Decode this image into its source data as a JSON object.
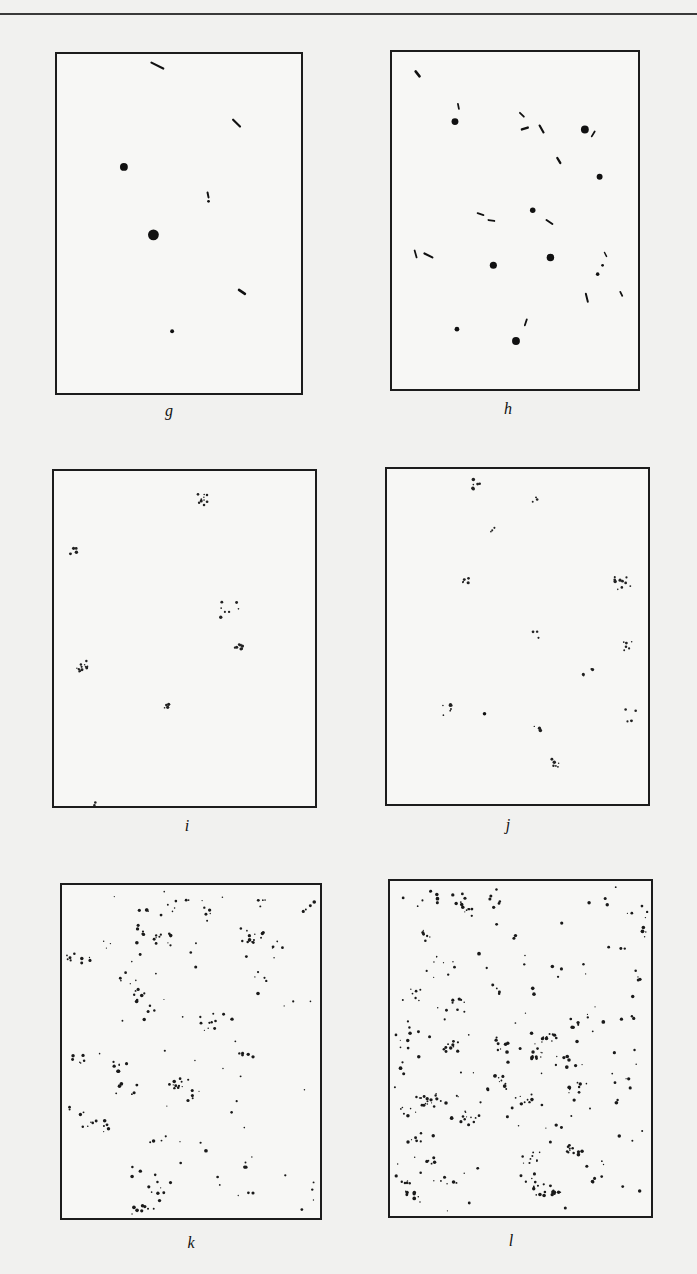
{
  "figure": {
    "panels": [
      {
        "id": "g",
        "label": "g",
        "box": [
          55,
          52,
          248,
          343
        ],
        "marks": [
          {
            "t": "line",
            "x1": 96,
            "y1": 8,
            "x2": 108,
            "y2": 14,
            "w": 2.2
          },
          {
            "t": "line",
            "x1": 179,
            "y1": 66,
            "x2": 186,
            "y2": 73,
            "w": 2.2
          },
          {
            "t": "dot",
            "cx": 68,
            "cy": 114,
            "r": 4
          },
          {
            "t": "line",
            "x1": 153,
            "y1": 140,
            "x2": 154,
            "y2": 145,
            "w": 2
          },
          {
            "t": "dot",
            "cx": 154,
            "cy": 149,
            "r": 1.4
          },
          {
            "t": "dot",
            "cx": 98,
            "cy": 183,
            "r": 5.5
          },
          {
            "t": "line",
            "x1": 185,
            "y1": 239,
            "x2": 191,
            "y2": 243,
            "w": 2.6
          },
          {
            "t": "dot",
            "cx": 117,
            "cy": 281,
            "r": 2
          }
        ]
      },
      {
        "id": "h",
        "label": "h",
        "box": [
          390,
          50,
          250,
          341
        ],
        "marks": [
          {
            "t": "line",
            "x1": 24,
            "y1": 19,
            "x2": 28,
            "y2": 24,
            "w": 2.6
          },
          {
            "t": "line",
            "x1": 67,
            "y1": 52,
            "x2": 68,
            "y2": 57,
            "w": 1.8
          },
          {
            "t": "dot",
            "cx": 64,
            "cy": 70,
            "r": 3.5
          },
          {
            "t": "line",
            "x1": 130,
            "y1": 61,
            "x2": 134,
            "y2": 65,
            "w": 1.8
          },
          {
            "t": "line",
            "x1": 132,
            "y1": 78,
            "x2": 138,
            "y2": 76,
            "w": 2.4
          },
          {
            "t": "line",
            "x1": 150,
            "y1": 74,
            "x2": 154,
            "y2": 81,
            "w": 2.2
          },
          {
            "t": "dot",
            "cx": 196,
            "cy": 78,
            "r": 4
          },
          {
            "t": "line",
            "x1": 203,
            "y1": 85,
            "x2": 206,
            "y2": 80,
            "w": 1.8
          },
          {
            "t": "line",
            "x1": 168,
            "y1": 107,
            "x2": 171,
            "y2": 112,
            "w": 2.4
          },
          {
            "t": "dot",
            "cx": 211,
            "cy": 126,
            "r": 3
          },
          {
            "t": "line",
            "x1": 87,
            "y1": 163,
            "x2": 93,
            "y2": 165,
            "w": 1.8
          },
          {
            "t": "line",
            "x1": 98,
            "y1": 170,
            "x2": 104,
            "y2": 171,
            "w": 1.8
          },
          {
            "t": "dot",
            "cx": 143,
            "cy": 160,
            "r": 2.8
          },
          {
            "t": "line",
            "x1": 157,
            "y1": 170,
            "x2": 163,
            "y2": 174,
            "w": 2
          },
          {
            "t": "line",
            "x1": 23,
            "y1": 201,
            "x2": 25,
            "y2": 208,
            "w": 1.8
          },
          {
            "t": "line",
            "x1": 33,
            "y1": 204,
            "x2": 41,
            "y2": 208,
            "w": 2.2
          },
          {
            "t": "dot",
            "cx": 103,
            "cy": 216,
            "r": 3.6
          },
          {
            "t": "dot",
            "cx": 161,
            "cy": 208,
            "r": 3.8
          },
          {
            "t": "line",
            "x1": 216,
            "y1": 203,
            "x2": 218,
            "y2": 207,
            "w": 1.5
          },
          {
            "t": "dot",
            "cx": 214,
            "cy": 216,
            "r": 1.4
          },
          {
            "t": "dot",
            "cx": 209,
            "cy": 225,
            "r": 1.8
          },
          {
            "t": "line",
            "x1": 197,
            "y1": 245,
            "x2": 199,
            "y2": 253,
            "w": 2
          },
          {
            "t": "line",
            "x1": 232,
            "y1": 243,
            "x2": 234,
            "y2": 247,
            "w": 1.8
          },
          {
            "t": "dot",
            "cx": 66,
            "cy": 281,
            "r": 2.4
          },
          {
            "t": "line",
            "x1": 135,
            "y1": 277,
            "x2": 137,
            "y2": 271,
            "w": 1.8
          },
          {
            "t": "dot",
            "cx": 126,
            "cy": 293,
            "r": 4
          }
        ]
      },
      {
        "id": "i",
        "label": "i",
        "box": [
          52,
          469,
          265,
          339
        ],
        "marks": [
          {
            "t": "cluster",
            "cx": 150,
            "cy": 28,
            "n": 10,
            "s": 6
          },
          {
            "t": "cluster",
            "cx": 20,
            "cy": 80,
            "n": 4,
            "s": 4
          },
          {
            "t": "cluster",
            "cx": 178,
            "cy": 140,
            "n": 7,
            "s": 10
          },
          {
            "t": "cluster",
            "cx": 188,
            "cy": 176,
            "n": 8,
            "s": 5
          },
          {
            "t": "cluster",
            "cx": 30,
            "cy": 198,
            "n": 14,
            "s": 7
          },
          {
            "t": "cluster",
            "cx": 114,
            "cy": 238,
            "n": 4,
            "s": 3
          },
          {
            "t": "cluster",
            "cx": 40,
            "cy": 336,
            "n": 2,
            "s": 3
          }
        ]
      },
      {
        "id": "j",
        "label": "j",
        "box": [
          385,
          467,
          265,
          339
        ],
        "marks": [
          {
            "t": "cluster",
            "cx": 90,
            "cy": 15,
            "n": 6,
            "s": 5
          },
          {
            "t": "cluster",
            "cx": 152,
            "cy": 28,
            "n": 3,
            "s": 5
          },
          {
            "t": "cluster",
            "cx": 108,
            "cy": 60,
            "n": 3,
            "s": 3
          },
          {
            "t": "cluster",
            "cx": 80,
            "cy": 112,
            "n": 5,
            "s": 3
          },
          {
            "t": "cluster",
            "cx": 240,
            "cy": 118,
            "n": 10,
            "s": 9
          },
          {
            "t": "cluster",
            "cx": 152,
            "cy": 167,
            "n": 3,
            "s": 4
          },
          {
            "t": "cluster",
            "cx": 242,
            "cy": 180,
            "n": 6,
            "s": 7
          },
          {
            "t": "cluster",
            "cx": 203,
            "cy": 208,
            "n": 5,
            "s": 6
          },
          {
            "t": "cluster",
            "cx": 62,
            "cy": 244,
            "n": 7,
            "s": 6
          },
          {
            "t": "dot",
            "cx": 99,
            "cy": 248,
            "r": 1.8
          },
          {
            "t": "cluster",
            "cx": 153,
            "cy": 262,
            "n": 3,
            "s": 4
          },
          {
            "t": "cluster",
            "cx": 250,
            "cy": 249,
            "n": 4,
            "s": 8
          },
          {
            "t": "cluster",
            "cx": 172,
            "cy": 296,
            "n": 6,
            "s": 6
          }
        ]
      },
      {
        "id": "k",
        "label": "k",
        "box": [
          60,
          883,
          262,
          337
        ],
        "marks": [
          {
            "t": "scatter",
            "n": 230,
            "clusters": 38,
            "seed": 11
          }
        ]
      },
      {
        "id": "l",
        "label": "l",
        "box": [
          388,
          879,
          265,
          339
        ],
        "marks": [
          {
            "t": "scatter",
            "n": 380,
            "clusters": 60,
            "seed": 23
          }
        ]
      }
    ],
    "labels": [
      {
        "text": "g",
        "x": 169,
        "y": 402
      },
      {
        "text": "h",
        "x": 508,
        "y": 400
      },
      {
        "text": "i",
        "x": 187,
        "y": 817
      },
      {
        "text": "j",
        "x": 508,
        "y": 816
      },
      {
        "text": "k",
        "x": 191,
        "y": 1234
      },
      {
        "text": "l",
        "x": 511,
        "y": 1232
      }
    ]
  }
}
